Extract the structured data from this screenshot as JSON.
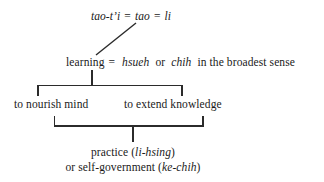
{
  "diagram": {
    "type": "hierarchy-tree",
    "line_color": "#2b2b2b",
    "text_color": "#1a1a1a",
    "background": "#ffffff",
    "nodes": {
      "root": {
        "id": "root",
        "parts": [
          {
            "text": "tao-t’i",
            "style": "italic"
          },
          {
            "text": "=",
            "style": "roman"
          },
          {
            "text": "tao",
            "style": "italic"
          },
          {
            "text": "=",
            "style": "roman"
          },
          {
            "text": "li",
            "style": "italic"
          }
        ],
        "plain": "tao-t’i = tao = li"
      },
      "learning": {
        "id": "learning",
        "parts": [
          {
            "text": "learning",
            "style": "roman"
          },
          {
            "text": "=",
            "style": "roman"
          },
          {
            "text": "hsueh",
            "style": "italic"
          },
          {
            "text": "or",
            "style": "roman"
          },
          {
            "text": "chih",
            "style": "italic"
          },
          {
            "text": "in the broadest sense",
            "style": "roman"
          }
        ],
        "plain": "learning = hsueh or chih in the broadest sense"
      },
      "nourish": {
        "id": "nourish",
        "plain": "to nourish mind"
      },
      "extend": {
        "id": "extend",
        "plain": "to extend knowledge"
      },
      "practice": {
        "id": "practice",
        "line1_parts": [
          {
            "text": "practice (",
            "style": "roman"
          },
          {
            "text": "li-hsing",
            "style": "italic"
          },
          {
            "text": ")",
            "style": "roman"
          }
        ],
        "line2_parts": [
          {
            "text": "or self-government (",
            "style": "roman"
          },
          {
            "text": "ke-chih",
            "style": "italic"
          },
          {
            "text": ")",
            "style": "roman"
          }
        ],
        "plain": "practice (li-hsing) or self-government (ke-chih)"
      }
    },
    "edges": [
      {
        "from": "root",
        "to": "learning",
        "shape": "diagonal"
      },
      {
        "from": "learning",
        "to": "nourish",
        "shape": "bracket-down"
      },
      {
        "from": "learning",
        "to": "extend",
        "shape": "bracket-down"
      },
      {
        "from": "nourish",
        "to": "practice",
        "shape": "bracket-up"
      },
      {
        "from": "extend",
        "to": "practice",
        "shape": "bracket-up"
      }
    ]
  },
  "text": {
    "root_tao_ti": "tao-t’i",
    "root_eq1": "=",
    "root_tao": "tao",
    "root_eq2": "=",
    "root_li": "li",
    "learning_word": "learning",
    "learning_eq": "=",
    "learning_hsueh": "hsueh",
    "learning_or": "or",
    "learning_chih": "chih",
    "learning_tail": "in the broadest sense",
    "nourish": "to nourish mind",
    "extend": "to extend knowledge",
    "practice_a": "practice (",
    "practice_li_hsing": "li-hsing",
    "practice_b": ")",
    "selfgov_a": "or self-government (",
    "selfgov_ke_chih": "ke-chih",
    "selfgov_b": ")"
  }
}
